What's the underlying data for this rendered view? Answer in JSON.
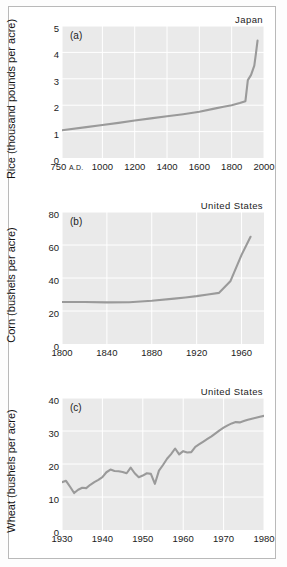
{
  "figure": {
    "background": "#ffffff",
    "frame_color": "#b9b9b9",
    "plot_background": "#eaeaea",
    "grid_color": "#ffffff",
    "line_color": "#9a9a9a"
  },
  "panels": [
    {
      "tag": "(a)",
      "country": "Japan",
      "ylabel": "Rice (thousand pounds per acre)",
      "yticks": [
        "0",
        "1",
        "2",
        "3",
        "4",
        "5"
      ],
      "xticks": [
        "750 A.D.",
        "1000",
        "1200",
        "1400",
        "1600",
        "1800",
        "2000"
      ]
    },
    {
      "tag": "(b)",
      "country": "United States",
      "ylabel": "Corn (bushels per acre)",
      "yticks": [
        "0",
        "20",
        "40",
        "60",
        "80"
      ],
      "xticks": [
        "1800",
        "1840",
        "1880",
        "1920",
        "1960"
      ]
    },
    {
      "tag": "(c)",
      "country": "United States",
      "ylabel": "Wheat (bushels per acre)",
      "yticks": [
        "0",
        "10",
        "20",
        "30",
        "40"
      ],
      "xticks": [
        "1930",
        "1940",
        "1950",
        "1960",
        "1970",
        "1980"
      ]
    }
  ],
  "chart_data": [
    {
      "type": "line",
      "title": "Japan",
      "panel": "(a)",
      "xlabel": "Year (A.D.)",
      "ylabel": "Rice (thousand pounds per acre)",
      "xlim": [
        750,
        2000
      ],
      "ylim": [
        0,
        5
      ],
      "xticks": [
        750,
        1000,
        1200,
        1400,
        1600,
        1800,
        2000
      ],
      "yticks": [
        0,
        1,
        2,
        3,
        4,
        5
      ],
      "grid": true,
      "legend": "none",
      "series": [
        {
          "name": "Rice yield, Japan",
          "x": [
            750,
            900,
            1000,
            1100,
            1200,
            1300,
            1400,
            1500,
            1600,
            1700,
            1750,
            1800,
            1850,
            1870,
            1885,
            1900,
            1920,
            1940,
            1950,
            1960
          ],
          "y": [
            1.05,
            1.17,
            1.25,
            1.33,
            1.42,
            1.5,
            1.58,
            1.66,
            1.75,
            1.88,
            1.94,
            2.0,
            2.08,
            2.12,
            2.15,
            2.95,
            3.15,
            3.5,
            3.95,
            4.45
          ]
        }
      ]
    },
    {
      "type": "line",
      "title": "United States",
      "panel": "(b)",
      "xlabel": "Year",
      "ylabel": "Corn (bushels per acre)",
      "xlim": [
        1800,
        1980
      ],
      "ylim": [
        0,
        80
      ],
      "xticks": [
        1800,
        1840,
        1880,
        1920,
        1960
      ],
      "yticks": [
        0,
        20,
        40,
        60,
        80
      ],
      "grid": true,
      "legend": "none",
      "series": [
        {
          "name": "Corn yield, United States",
          "x": [
            1800,
            1820,
            1840,
            1860,
            1870,
            1880,
            1900,
            1910,
            1920,
            1930,
            1940,
            1950,
            1960,
            1968
          ],
          "y": [
            25.5,
            25.5,
            25.2,
            25.3,
            25.8,
            26.2,
            27.5,
            28.2,
            29.0,
            30.0,
            31.0,
            38.0,
            54.0,
            65.0
          ]
        }
      ]
    },
    {
      "type": "line",
      "title": "United States",
      "panel": "(c)",
      "xlabel": "Year",
      "ylabel": "Wheat (bushels per acre)",
      "xlim": [
        1930,
        1980
      ],
      "ylim": [
        0,
        40
      ],
      "xticks": [
        1930,
        1940,
        1950,
        1960,
        1970,
        1980
      ],
      "yticks": [
        0,
        10,
        20,
        30,
        40
      ],
      "grid": true,
      "legend": "none",
      "series": [
        {
          "name": "Wheat yield, United States",
          "x": [
            1930,
            1931,
            1932,
            1933,
            1934,
            1935,
            1936,
            1937,
            1938,
            1939,
            1940,
            1941,
            1942,
            1943,
            1944,
            1945,
            1946,
            1947,
            1948,
            1949,
            1950,
            1951,
            1952,
            1953,
            1954,
            1955,
            1956,
            1957,
            1958,
            1959,
            1960,
            1961,
            1962,
            1963,
            1964,
            1965,
            1966,
            1967,
            1968,
            1969,
            1970,
            1971,
            1972,
            1973,
            1974,
            1975,
            1976,
            1977,
            1978,
            1979,
            1980
          ],
          "y": [
            14.5,
            14.9,
            13.1,
            11.2,
            12.2,
            12.8,
            12.7,
            13.7,
            14.5,
            15.2,
            16.0,
            17.5,
            18.3,
            17.9,
            17.8,
            17.6,
            17.2,
            18.9,
            17.2,
            16.0,
            16.5,
            17.2,
            17.0,
            14.0,
            18.0,
            19.7,
            21.6,
            23.0,
            24.7,
            22.9,
            23.9,
            23.5,
            23.6,
            25.2,
            26.0,
            26.8,
            27.6,
            28.4,
            29.3,
            30.2,
            31.0,
            31.7,
            32.3,
            32.7,
            32.6,
            33.0,
            33.4,
            33.7,
            34.0,
            34.3,
            34.6
          ]
        }
      ]
    }
  ]
}
